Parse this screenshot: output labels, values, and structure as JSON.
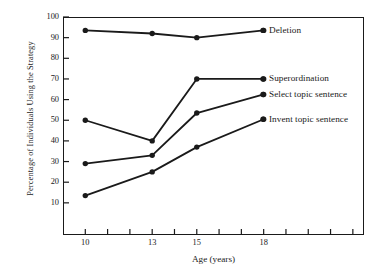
{
  "chart_data": {
    "type": "line",
    "title": "",
    "xlabel": "Age (years)",
    "ylabel": "Percentage of Individuals Using the Strategy",
    "categories": [
      "10",
      "13",
      "15",
      "18"
    ],
    "x": [
      10,
      13,
      15,
      18
    ],
    "xlim": [
      9,
      22.5
    ],
    "ylim": [
      0,
      100
    ],
    "y_ticks": [
      100,
      90,
      80,
      70,
      60,
      50,
      40,
      30,
      20,
      10
    ],
    "x_ticks": [
      10,
      13,
      15,
      18
    ],
    "x_tick_labels": [
      "10",
      "13",
      "15",
      "18"
    ],
    "grid": false,
    "legend_position": "right-inline",
    "marker": "filled-circle",
    "line_color": "#1a1a1a",
    "series": [
      {
        "name": "Deletion",
        "label": "Deletion",
        "values": [
          93.5,
          92,
          90,
          93.5
        ],
        "label_y": 93.5
      },
      {
        "name": "Superordination",
        "label": "Superordination",
        "values": [
          50,
          40,
          70,
          70
        ],
        "label_y": 70
      },
      {
        "name": "Select topic sentence",
        "label": "Select topic sentence",
        "values": [
          29,
          33,
          53.5,
          62.5
        ],
        "label_y": 62.5
      },
      {
        "name": "Invent topic sentence",
        "label": "Invent topic sentence",
        "values": [
          13.5,
          25,
          37,
          50.5
        ],
        "label_y": 50.5
      }
    ]
  },
  "axes": {
    "y_title": "Percentage of Individuals Using the Strategy",
    "x_title": "Age (years)",
    "y_tick_labels": [
      "100",
      "90",
      "80",
      "70",
      "60",
      "50",
      "40",
      "30",
      "20",
      "10"
    ],
    "x_tick_labels": [
      "10",
      "13",
      "15",
      "18"
    ]
  },
  "colors": {
    "ink": "#1a1a1a",
    "background": "#ffffff"
  }
}
